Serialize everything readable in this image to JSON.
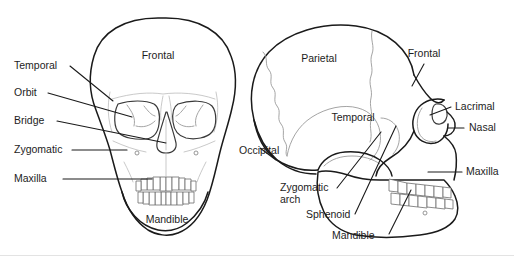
{
  "figure": {
    "background_color": "#ffffff",
    "line_color": "#1a1a1a",
    "suture_color": "#9a9a9a",
    "text_color": "#1d1d1d"
  },
  "anterior_view": {
    "name": "anterior-skull-view",
    "labels": [
      {
        "id": "temporal",
        "text": "Temporal",
        "x": 14,
        "y": 69,
        "anchor": "start"
      },
      {
        "id": "orbit",
        "text": "Orbit",
        "x": 14,
        "y": 96,
        "anchor": "start"
      },
      {
        "id": "bridge",
        "text": "Bridge",
        "x": 14,
        "y": 124,
        "anchor": "start"
      },
      {
        "id": "zygomatic",
        "text": "Zygomatic",
        "x": 14,
        "y": 153,
        "anchor": "start"
      },
      {
        "id": "maxilla",
        "text": "Maxilla",
        "x": 14,
        "y": 182,
        "anchor": "start"
      },
      {
        "id": "frontal",
        "text": "Frontal",
        "x": 158,
        "y": 59,
        "anchor": "middle"
      },
      {
        "id": "mandible",
        "text": "Mandible",
        "x": 167,
        "y": 223,
        "anchor": "middle"
      }
    ]
  },
  "lateral_view": {
    "name": "lateral-skull-view",
    "labels": [
      {
        "id": "parietal",
        "text": "Parietal",
        "x": 319,
        "y": 62,
        "anchor": "middle"
      },
      {
        "id": "frontal",
        "text": "Frontal",
        "x": 424,
        "y": 57,
        "anchor": "middle"
      },
      {
        "id": "temporal",
        "text": "Temporal",
        "x": 353,
        "y": 121,
        "anchor": "middle"
      },
      {
        "id": "occipital",
        "text": "Occipital",
        "x": 239,
        "y": 154,
        "anchor": "start"
      },
      {
        "id": "lacrimal",
        "text": "Lacrimal",
        "x": 455,
        "y": 110,
        "anchor": "start"
      },
      {
        "id": "nasal",
        "text": "Nasal",
        "x": 469,
        "y": 131,
        "anchor": "start"
      },
      {
        "id": "maxilla",
        "text": "Maxilla",
        "x": 466,
        "y": 175,
        "anchor": "start"
      },
      {
        "id": "zygomatic-arch-line1",
        "text": "Zygomatic",
        "x": 280,
        "y": 191,
        "anchor": "start"
      },
      {
        "id": "zygomatic-arch-line2",
        "text": "arch",
        "x": 280,
        "y": 203,
        "anchor": "start"
      },
      {
        "id": "sphenoid",
        "text": "Sphenoid",
        "x": 306,
        "y": 218,
        "anchor": "start"
      },
      {
        "id": "mandible",
        "text": "Mandible",
        "x": 332,
        "y": 239,
        "anchor": "start"
      }
    ]
  }
}
